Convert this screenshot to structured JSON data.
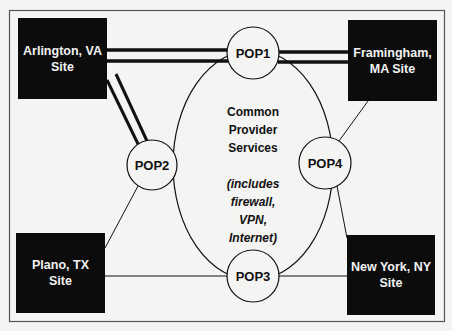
{
  "diagram": {
    "sites": [
      {
        "id": "arlington",
        "line1": "Arlington, VA",
        "line2": "Site"
      },
      {
        "id": "framingham",
        "line1": "Framingham,",
        "line2": "MA Site"
      },
      {
        "id": "plano",
        "line1": "Plano, TX",
        "line2": "Site"
      },
      {
        "id": "newyork",
        "line1": "New York, NY",
        "line2": "Site"
      }
    ],
    "pops": [
      {
        "id": "pop1",
        "label": "POP1"
      },
      {
        "id": "pop2",
        "label": "POP2"
      },
      {
        "id": "pop3",
        "label": "POP3"
      },
      {
        "id": "pop4",
        "label": "POP4"
      }
    ],
    "provider": {
      "title_lines": [
        "Common",
        "Provider",
        "Services"
      ],
      "note_lines": [
        "(includes",
        "firewall,",
        "VPN,",
        "Internet)"
      ]
    },
    "links": [
      {
        "from": "arlington",
        "to": "pop1",
        "style": "double-thick"
      },
      {
        "from": "pop1",
        "to": "framingham",
        "style": "double-thick"
      },
      {
        "from": "arlington",
        "to": "pop2",
        "style": "double-thick"
      },
      {
        "from": "pop2",
        "to": "plano",
        "style": "thin"
      },
      {
        "from": "plano",
        "to": "pop3",
        "style": "thin"
      },
      {
        "from": "pop3",
        "to": "newyork",
        "style": "thin"
      },
      {
        "from": "newyork",
        "to": "pop4",
        "style": "thin"
      },
      {
        "from": "pop4",
        "to": "framingham",
        "style": "thin"
      }
    ],
    "colors": {
      "site_fill": "#0c0c0c",
      "site_text": "#f2f2f2",
      "line": "#111111",
      "background": "#f4f4f2"
    }
  }
}
